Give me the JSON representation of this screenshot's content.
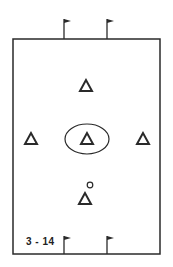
{
  "diagram": {
    "label": "3 - 14",
    "field": {
      "x": 13,
      "y": 39,
      "width": 147,
      "height": 215
    },
    "colors": {
      "line": "#2a2a2a",
      "background": "#ffffff"
    },
    "flags": [
      {
        "position": "top-left",
        "x": 64,
        "y": 39
      },
      {
        "position": "top-right",
        "x": 107,
        "y": 39
      },
      {
        "position": "bottom-left",
        "x": 64,
        "y": 254
      },
      {
        "position": "bottom-right",
        "x": 107,
        "y": 254
      }
    ],
    "players": [
      {
        "name": "top",
        "x": 86,
        "y": 88
      },
      {
        "name": "left",
        "x": 31,
        "y": 139
      },
      {
        "name": "center",
        "x": 87,
        "y": 139,
        "circled": true
      },
      {
        "name": "right",
        "x": 143,
        "y": 139
      },
      {
        "name": "bottom-with-ball",
        "x": 86,
        "y": 199,
        "ball": true
      }
    ]
  }
}
